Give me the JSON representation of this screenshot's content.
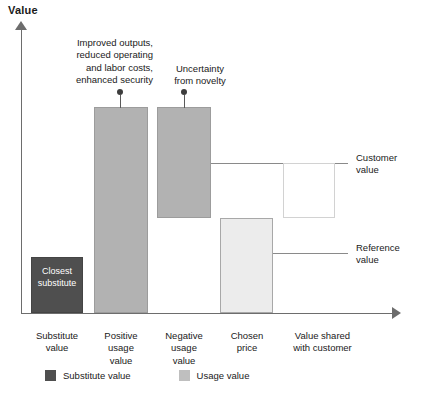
{
  "chart_data": {
    "type": "bar",
    "title": "Value",
    "subtitle": "",
    "xlabel": "",
    "ylabel": "Value",
    "grid": false,
    "legend_position": "bottom-left",
    "axis_arrows": true,
    "categories": [
      "Substitute\nvalue",
      "Positive\nusage\nvalue",
      "Negative\nusage\nvalue",
      "Chosen\nprice",
      "Value shared\nwith customer"
    ],
    "category_labels": [
      "Substitute value",
      "Positive usage value",
      "Negative usage value",
      "Chosen price",
      "Value shared with customer"
    ],
    "series": [
      {
        "name": "Substitute value",
        "color": "#4f4f4f",
        "values": [
          27,
          null,
          null,
          null,
          null
        ]
      },
      {
        "name": "Usage value",
        "color": "#b2b2b2",
        "values": [
          null,
          100,
          48,
          null,
          null
        ]
      },
      {
        "name": "Chosen price",
        "color": "#ececec",
        "values": [
          null,
          null,
          null,
          46,
          null
        ]
      },
      {
        "name": "Value shared with customer",
        "color": "#ffffff",
        "values": [
          null,
          null,
          null,
          null,
          27
        ]
      }
    ],
    "waterfall_segments": [
      {
        "label": "Substitute value",
        "bottom": 0,
        "top": 27,
        "fill": "#4f4f4f"
      },
      {
        "label": "Positive usage value",
        "bottom": 0,
        "top": 100,
        "fill": "#b2b2b2"
      },
      {
        "label": "Negative usage value",
        "bottom": 46,
        "top": 100,
        "fill": "#b2b2b2"
      },
      {
        "label": "Chosen price",
        "bottom": 0,
        "top": 46,
        "fill": "#ececec"
      },
      {
        "label": "Value shared with customer",
        "bottom": 46,
        "top": 73,
        "fill": "#ffffff"
      }
    ],
    "reference_lines": [
      {
        "label": "Customer value",
        "value": 73
      },
      {
        "label": "Reference value",
        "value": 29
      }
    ],
    "annotations": [
      {
        "target": "Positive usage value",
        "text": "Improved outputs, reduced operating and labor costs, enhanced security"
      },
      {
        "target": "Negative usage value",
        "text": "Uncertainty from novelty"
      }
    ],
    "in_bar_labels": [
      {
        "target": "Substitute value",
        "text": "Closest substitute",
        "color": "#ffffff"
      }
    ],
    "ylim": [
      0,
      115
    ]
  },
  "title": {
    "text": "Value"
  },
  "bars": {
    "substitute": {
      "in_label_line1": "Closest",
      "in_label_line2": "substitute"
    },
    "positive_usage": {},
    "negative_usage": {},
    "chosen_price": {},
    "value_shared": {}
  },
  "callouts": {
    "positive": {
      "line1": "Improved outputs,",
      "line2": "reduced operating",
      "line3": "and labor costs,",
      "line4": "enhanced security"
    },
    "negative": {
      "line1": "Uncertainty",
      "line2": "from novelty"
    }
  },
  "guides": {
    "customer_value": {
      "line1": "Customer",
      "line2": "value"
    },
    "reference_value": {
      "line1": "Reference",
      "line2": "value"
    }
  },
  "categories": [
    {
      "line1": "Substitute",
      "line2": "value",
      "line3": ""
    },
    {
      "line1": "Positive",
      "line2": "usage",
      "line3": "value"
    },
    {
      "line1": "Negative",
      "line2": "usage",
      "line3": "value"
    },
    {
      "line1": "Chosen",
      "line2": "price",
      "line3": ""
    },
    {
      "line1": "Value shared",
      "line2": "with customer",
      "line3": ""
    }
  ],
  "legend": {
    "items": [
      {
        "label": "Substitute value",
        "color": "#4f4f4f"
      },
      {
        "label": "Usage value",
        "color": "#bfbfbf"
      }
    ]
  }
}
